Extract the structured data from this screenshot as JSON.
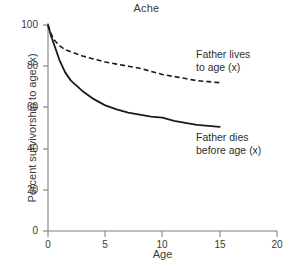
{
  "chart_data": {
    "type": "line",
    "title": "Ache",
    "xlabel": "Age",
    "ylabel": "Percent survivorship to age (x)",
    "xlim": [
      0,
      20
    ],
    "ylim": [
      0,
      100
    ],
    "xticks": [
      0,
      5,
      10,
      15,
      20
    ],
    "yticks": [
      0,
      20,
      40,
      60,
      80,
      100
    ],
    "xtick_labels": [
      "0",
      "5",
      "10",
      "15",
      "20"
    ],
    "ytick_labels": [
      "0",
      "20",
      "40",
      "60",
      "80",
      "100"
    ],
    "grid": false,
    "legend_position": "inline-annotations",
    "series": [
      {
        "name": "Father lives to age (x)",
        "style": "dashed",
        "color": "#1a1a1a",
        "x": [
          0,
          0.25,
          0.5,
          1,
          1.5,
          2,
          3,
          4,
          5,
          6,
          7,
          8,
          9,
          10,
          11,
          12,
          13,
          14,
          15
        ],
        "values": [
          100,
          96,
          93,
          90,
          88,
          87,
          85,
          83.5,
          82,
          81,
          80,
          79,
          77.5,
          76,
          75,
          74,
          73,
          72.5,
          72
        ]
      },
      {
        "name": "Father dies before age (x)",
        "style": "solid",
        "color": "#1a1a1a",
        "x": [
          0,
          0.25,
          0.5,
          1,
          1.5,
          2,
          3,
          4,
          5,
          6,
          7,
          8,
          9,
          10,
          11,
          12,
          13,
          14,
          15
        ],
        "values": [
          100,
          95,
          91,
          83,
          77,
          73,
          68,
          64,
          61,
          59,
          57.5,
          56.5,
          55.5,
          55,
          53.5,
          52.5,
          51.5,
          51,
          50.5
        ]
      }
    ],
    "annotations": [
      {
        "name": "father-lives-annotation",
        "line1": "Father lives",
        "line2": "to age (x)"
      },
      {
        "name": "father-dies-annotation",
        "line1": "Father dies",
        "line2": "before age (x)"
      }
    ],
    "axis_color": "#808080",
    "line_color": "#1a1a1a",
    "text_color": "#3a3a3a"
  }
}
